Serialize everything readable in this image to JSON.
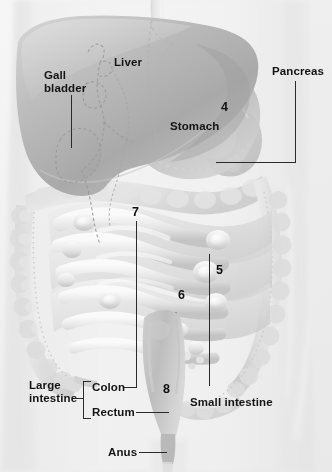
{
  "figure": {
    "background_color": "#f2f2f2",
    "label_color": "#141414",
    "leader_color": "#2b2b2b"
  },
  "labels": {
    "gall_bladder_line1": "Gall",
    "gall_bladder_line2": "bladder",
    "liver": "Liver",
    "pancreas": "Pancreas",
    "stomach": "Stomach",
    "large_intestine_line1": "Large",
    "large_intestine_line2": "intestine",
    "colon": "Colon",
    "rectum": "Rectum",
    "anus": "Anus",
    "small_intestine": "Small intestine"
  },
  "numbers": {
    "n4": "4",
    "n5": "5",
    "n6": "6",
    "n7": "7",
    "n8": "8"
  },
  "organs": {
    "liver": "liver-shape",
    "stomach": "stomach-shape",
    "pancreas": "pancreas-shape",
    "gall_bladder": "gall-bladder-shape",
    "colon": "large-intestine-shape",
    "small_intestine": "small-intestine-shape",
    "rectum": "rectum-shape",
    "anus": "anus-shape",
    "esophagus": "esophagus-shape",
    "torso": "torso-silhouette"
  }
}
